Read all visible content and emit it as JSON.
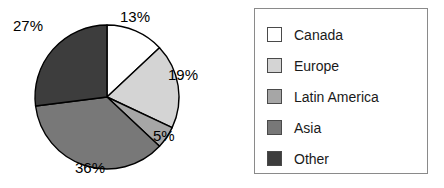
{
  "chart_data": {
    "type": "pie",
    "title": "",
    "categories": [
      "Canada",
      "Europe",
      "Latin America",
      "Asia",
      "Other"
    ],
    "values": [
      13,
      19,
      5,
      36,
      27
    ],
    "value_labels": [
      "13%",
      "19%",
      "5%",
      "36%",
      "27%"
    ],
    "unit": "%",
    "colors": [
      "#ffffff",
      "#d4d4d4",
      "#a6a6a6",
      "#787878",
      "#3d3d3d"
    ],
    "slice_border_color": "#000000",
    "start_angle_deg": 0,
    "direction": "clockwise",
    "legend": {
      "position": "right",
      "border_color": "#8a8a8a",
      "entries": [
        {
          "label": "Canada",
          "color": "#ffffff",
          "value": 13
        },
        {
          "label": "Europe",
          "color": "#d4d4d4",
          "value": 19
        },
        {
          "label": "Latin America",
          "color": "#a6a6a6",
          "value": 5
        },
        {
          "label": "Asia",
          "color": "#787878",
          "value": 36
        },
        {
          "label": "Other",
          "color": "#3d3d3d",
          "value": 27
        }
      ]
    },
    "labels_outside": true,
    "grid": false,
    "xlabel": "",
    "ylabel": ""
  },
  "pie_labels": [
    {
      "text": "13%",
      "left": 120,
      "top": 8
    },
    {
      "text": "19%",
      "left": 168,
      "top": 66
    },
    {
      "text": "5%",
      "left": 153,
      "top": 127
    },
    {
      "text": "36%",
      "left": 75,
      "top": 159
    },
    {
      "text": "27%",
      "left": 13,
      "top": 17
    }
  ]
}
